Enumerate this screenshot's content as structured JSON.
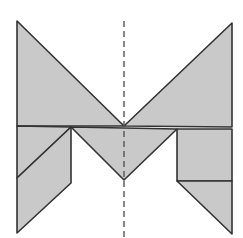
{
  "diagram": {
    "title": "",
    "colors": {
      "fill": "#c9c9c9",
      "stroke": "#333333",
      "axis": "#555555",
      "background": "#ffffff"
    },
    "symmetry_axis": {
      "x": 124,
      "y1": 21,
      "y2": 238,
      "style": "dashed"
    },
    "pieces": [
      {
        "name": "large-triangle-left",
        "points": "17,21 17,126 124,126"
      },
      {
        "name": "large-triangle-right",
        "points": "232,23 124,126 232,127"
      },
      {
        "name": "small-triangle-left-top",
        "points": "17,126 71,127 17,178"
      },
      {
        "name": "parallelogram-left",
        "points": "17,178 71,127 71,183 17,233"
      },
      {
        "name": "medium-triangle-center",
        "points": "71,127 177,129 124,180"
      },
      {
        "name": "square-right",
        "points": "177,129 232,129 232,181 177,181"
      },
      {
        "name": "small-triangle-right-bottom",
        "points": "177,181 232,181 232,234"
      }
    ]
  }
}
